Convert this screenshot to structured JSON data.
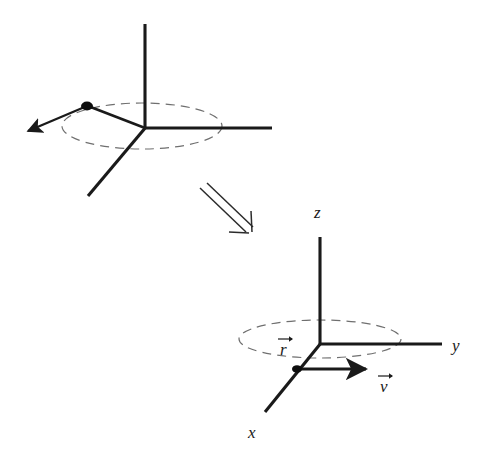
{
  "figure": {
    "background_color": "#ffffff",
    "stroke_color": "#1a1a1a",
    "dashed_color": "#6b6b6b",
    "width": 500,
    "height": 462
  },
  "panels": [
    {
      "id": "top-panel",
      "name": "tilted-frame",
      "labels_shown": false,
      "origin": {
        "x": 145,
        "y": 128
      },
      "axes": [
        {
          "name": "z-axis",
          "label": "",
          "from": [
            145,
            128
          ],
          "to": [
            145,
            24
          ]
        },
        {
          "name": "y-axis",
          "label": "",
          "from": [
            145,
            128
          ],
          "to": [
            272,
            128
          ]
        },
        {
          "name": "x-axis",
          "label": "",
          "from": [
            145,
            128
          ],
          "to": [
            88,
            196
          ]
        }
      ],
      "orbit": {
        "name": "orbit-ellipse",
        "center": [
          142,
          126
        ],
        "rx": 80,
        "ry": 23,
        "dashed": true
      },
      "particle": {
        "name": "particle-dot",
        "x": 87,
        "y": 106,
        "r": 5
      },
      "velocity": {
        "name": "velocity-arrow",
        "from": [
          87,
          106
        ],
        "to": [
          24,
          133
        ],
        "label": ""
      }
    },
    {
      "id": "bottom-panel",
      "name": "co-rotating-frame",
      "labels_shown": true,
      "origin": {
        "x": 320,
        "y": 344
      },
      "axes": [
        {
          "name": "z-axis",
          "label": "z",
          "from": [
            320,
            344
          ],
          "to": [
            320,
            237
          ],
          "label_x": 318,
          "label_y": 215
        },
        {
          "name": "y-axis",
          "label": "y",
          "from": [
            320,
            344
          ],
          "to": [
            442,
            344
          ],
          "label_x": 452,
          "label_y": 349
        },
        {
          "name": "x-axis",
          "label": "x",
          "from": [
            320,
            344
          ],
          "to": [
            265,
            412
          ],
          "label_x": 249,
          "label_y": 436
        }
      ],
      "orbit": {
        "name": "orbit-ellipse",
        "center": [
          320,
          339
        ],
        "rx": 81,
        "ry": 19,
        "dashed": true
      },
      "particle": {
        "name": "particle-dot",
        "x": 297,
        "y": 369,
        "r": 4
      },
      "velocity": {
        "name": "velocity-arrow",
        "from": [
          297,
          369
        ],
        "to": [
          372,
          369
        ],
        "label": "v",
        "label_x": 382,
        "label_y": 389
      },
      "radius": {
        "name": "radius-vector-label",
        "label": "r",
        "label_x": 283,
        "label_y": 352
      }
    }
  ],
  "transition_arrow": {
    "name": "implies-arrow",
    "glyph": "double-line-arrow-down-right",
    "from": [
      200,
      190
    ],
    "to": [
      252,
      240
    ]
  },
  "text": {
    "z_label": "z",
    "y_label": "y",
    "x_label": "x",
    "r_label": "r",
    "v_label": "v",
    "vector_accent": "⃗"
  }
}
